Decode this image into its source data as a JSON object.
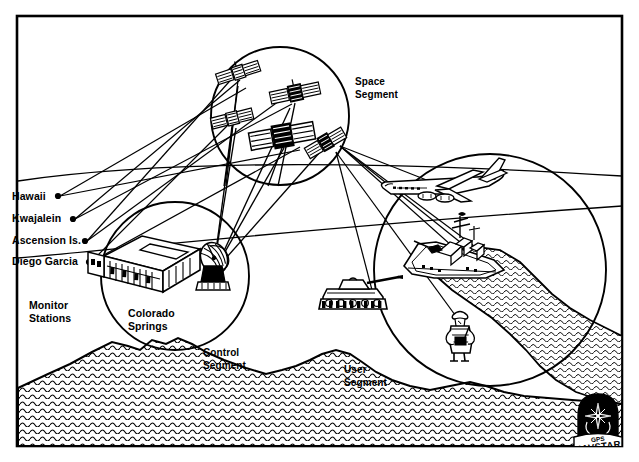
{
  "figure": {
    "ink_color": "#000000",
    "background_color": "#ffffff"
  },
  "segments": [
    {
      "id": "space",
      "label": "Space\nSegment",
      "label_x": 355,
      "label_y": 76,
      "cx": 280,
      "cy": 116,
      "r": 69
    },
    {
      "id": "control",
      "label": "Control\nSegment",
      "label_x": 203,
      "label_y": 347,
      "cx": 175,
      "cy": 276,
      "r": 74
    },
    {
      "id": "user",
      "label": "User\nSegment",
      "label_x": 344,
      "label_y": 364,
      "cx": 490,
      "cy": 270,
      "r": 116
    }
  ],
  "site_labels": [
    {
      "id": "colorado-springs",
      "label": "Colorado\nSprings",
      "x": 128,
      "y": 307
    }
  ],
  "monitor_stations": {
    "group_label": "Monitor\nStations",
    "group_label_x": 29,
    "group_label_y": 299,
    "items": [
      {
        "name": "Hawaii",
        "label_x": 12,
        "label_y": 190,
        "dot_x": 58,
        "dot_y": 196
      },
      {
        "name": "Kwajalein",
        "label_x": 12,
        "label_y": 213,
        "dot_x": 73,
        "dot_y": 219
      },
      {
        "name": "Ascension Is.",
        "label_x": 12,
        "label_y": 235,
        "dot_x": 85,
        "dot_y": 241
      },
      {
        "name": "Diego Garcia",
        "label_x": 12,
        "label_y": 256,
        "dot_x": 89,
        "dot_y": 262
      }
    ]
  },
  "space_segment_objects": [
    {
      "name": "satellite-1",
      "x": 238,
      "y": 72
    },
    {
      "name": "satellite-2",
      "x": 232,
      "y": 118
    },
    {
      "name": "satellite-3",
      "x": 295,
      "y": 93
    },
    {
      "name": "satellite-4",
      "x": 282,
      "y": 136
    },
    {
      "name": "satellite-5",
      "x": 325,
      "y": 140
    }
  ],
  "control_segment_objects": [
    {
      "name": "master-control-building",
      "x": 95,
      "y": 240
    },
    {
      "name": "ground-antenna-dish",
      "x": 205,
      "y": 248
    }
  ],
  "user_segment_objects": [
    {
      "name": "aircraft",
      "x": 443,
      "y": 186
    },
    {
      "name": "naval-ship",
      "x": 452,
      "y": 248
    },
    {
      "name": "tank",
      "x": 353,
      "y": 293
    },
    {
      "name": "soldier",
      "x": 460,
      "y": 333
    }
  ],
  "logo": {
    "line1": "GPS",
    "line2": "NAVSTAR",
    "x": 578,
    "y": 396,
    "width": 58,
    "height": 62
  },
  "terrain": {
    "name": "mountain-range-hatched",
    "fill_pattern": "wavy-hatch"
  }
}
